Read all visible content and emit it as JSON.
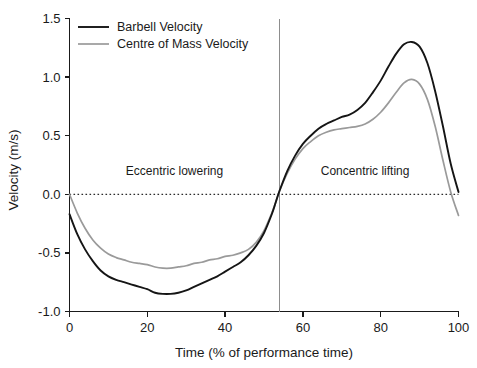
{
  "chart_data": {
    "type": "line",
    "title": "",
    "xlabel": "Time (% of performance time)",
    "ylabel": "Velocity (m/s)",
    "xlim": [
      0,
      100
    ],
    "ylim": [
      -1.0,
      1.5
    ],
    "xticks": [
      0,
      20,
      40,
      60,
      80,
      100
    ],
    "xtick_labels": [
      "0",
      "20",
      "40",
      "60",
      "80",
      "100"
    ],
    "yticks": [
      -1.0,
      -0.5,
      0.0,
      0.5,
      1.0,
      1.5
    ],
    "ytick_labels": [
      "-1.0",
      "-0.5",
      "0.0",
      "0.5",
      "1.0",
      "1.5"
    ],
    "grid": false,
    "legend_position": "top-left",
    "zero_reference_line": 0.0,
    "phase_divider_x": 54,
    "annotations": [
      {
        "text": "Eccentric lowering",
        "x": 27,
        "y": 0.2
      },
      {
        "text": "Concentric lifting",
        "x": 76,
        "y": 0.2
      }
    ],
    "series": [
      {
        "name": "Barbell Velocity",
        "color": "#151515",
        "x": [
          0,
          2,
          4,
          6,
          8,
          10,
          12,
          14,
          16,
          18,
          20,
          22,
          24,
          26,
          28,
          30,
          32,
          34,
          36,
          38,
          40,
          42,
          44,
          46,
          48,
          50,
          52,
          53,
          54,
          56,
          58,
          60,
          62,
          64,
          66,
          68,
          70,
          72,
          74,
          76,
          78,
          80,
          82,
          84,
          86,
          88,
          90,
          92,
          94,
          96,
          98,
          100
        ],
        "values": [
          -0.17,
          -0.34,
          -0.47,
          -0.57,
          -0.65,
          -0.7,
          -0.73,
          -0.75,
          -0.77,
          -0.79,
          -0.81,
          -0.84,
          -0.85,
          -0.85,
          -0.84,
          -0.82,
          -0.79,
          -0.76,
          -0.73,
          -0.7,
          -0.66,
          -0.62,
          -0.58,
          -0.52,
          -0.44,
          -0.33,
          -0.17,
          -0.07,
          0.03,
          0.2,
          0.33,
          0.43,
          0.5,
          0.56,
          0.6,
          0.63,
          0.66,
          0.68,
          0.72,
          0.78,
          0.87,
          0.97,
          1.09,
          1.2,
          1.28,
          1.3,
          1.26,
          1.12,
          0.88,
          0.58,
          0.26,
          0.02
        ]
      },
      {
        "name": "Centre of Mass Velocity",
        "color": "#9a9a9a",
        "x": [
          0,
          2,
          4,
          6,
          8,
          10,
          12,
          14,
          16,
          18,
          20,
          22,
          24,
          26,
          28,
          30,
          32,
          34,
          36,
          38,
          40,
          42,
          44,
          46,
          48,
          50,
          52,
          53,
          54,
          56,
          58,
          60,
          62,
          64,
          66,
          68,
          70,
          72,
          74,
          76,
          78,
          80,
          82,
          84,
          86,
          88,
          90,
          92,
          94,
          96,
          98,
          100
        ],
        "values": [
          0.0,
          -0.16,
          -0.29,
          -0.39,
          -0.46,
          -0.51,
          -0.54,
          -0.56,
          -0.58,
          -0.59,
          -0.6,
          -0.62,
          -0.63,
          -0.63,
          -0.62,
          -0.61,
          -0.59,
          -0.58,
          -0.56,
          -0.55,
          -0.53,
          -0.52,
          -0.5,
          -0.47,
          -0.41,
          -0.31,
          -0.16,
          -0.07,
          0.03,
          0.18,
          0.3,
          0.39,
          0.45,
          0.5,
          0.53,
          0.55,
          0.56,
          0.57,
          0.58,
          0.6,
          0.64,
          0.7,
          0.78,
          0.87,
          0.95,
          0.98,
          0.94,
          0.81,
          0.58,
          0.29,
          0.02,
          -0.18
        ]
      }
    ]
  },
  "legend": {
    "items": [
      {
        "label": "Barbell Velocity"
      },
      {
        "label": "Centre of Mass Velocity"
      }
    ]
  }
}
